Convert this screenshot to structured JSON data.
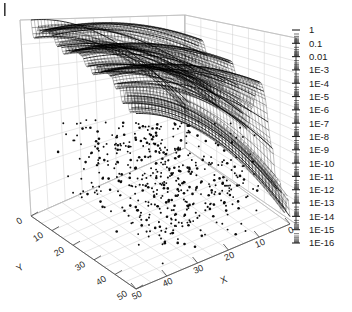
{
  "figure": {
    "type": "3d-surface-plot",
    "background": "#ffffff",
    "corner_mark": "|"
  },
  "chart_data": {
    "type": "scatter",
    "title": "",
    "subtitle": "",
    "xlabel": "X",
    "ylabel": "Y",
    "zlabel": "",
    "projection": "3d",
    "grid": true,
    "legend": "none",
    "x": {
      "label": "X",
      "ticks": [
        50,
        40,
        30,
        20,
        10,
        0
      ],
      "tick_labels": [
        "50",
        "40",
        "30",
        "20",
        "10",
        "0"
      ],
      "range": [
        50,
        0
      ],
      "reversed": true,
      "scale": "linear"
    },
    "y": {
      "label": "Y",
      "ticks": [
        0,
        10,
        20,
        30,
        40,
        50
      ],
      "tick_labels": [
        "0",
        "10",
        "20",
        "30",
        "40",
        "50"
      ],
      "range": [
        0,
        50
      ],
      "scale": "linear"
    },
    "z": {
      "label": "",
      "scale": "log",
      "range": [
        1e-16,
        1
      ],
      "tick_labels": [
        "1",
        "0.1",
        "0.01",
        "1E-3",
        "1E-4",
        "1E-5",
        "1E-6",
        "1E-7",
        "1E-8",
        "1E-9",
        "1E-10",
        "1E-11",
        "1E-12",
        "1E-13",
        "1E-14",
        "1E-15",
        "1E-16"
      ],
      "tick_values": [
        1,
        0.1,
        0.01,
        0.001,
        0.0001,
        1e-05,
        1e-06,
        1e-07,
        1e-08,
        1e-09,
        1e-10,
        1e-11,
        1e-12,
        1e-13,
        1e-14,
        1e-15,
        1e-16
      ],
      "minor_ticks_per_decade": 9
    },
    "series": [
      {
        "name": "error-surface",
        "style": "dense-mesh-curves",
        "color": "#000000",
        "description": "Oscillatory decaying surface with three ridges along Y, magnitude falling from 1 to below 1E-16"
      },
      {
        "name": "scatter-noise",
        "style": "points",
        "color": "#000000",
        "description": "Scattered low-magnitude points below the surface near machine precision"
      }
    ],
    "ridge_count": 3,
    "ridge_y_positions": [
      8,
      22,
      36
    ]
  },
  "axes": {
    "x_ticks": [
      "50",
      "40",
      "30",
      "20",
      "10",
      "0"
    ],
    "y_ticks": [
      "0",
      "10",
      "20",
      "30",
      "40",
      "50"
    ],
    "x_title": "X",
    "y_title": "Y",
    "z_ticks": [
      "1",
      "0.1",
      "0.01",
      "1E-3",
      "1E-4",
      "1E-5",
      "1E-6",
      "1E-7",
      "1E-8",
      "1E-9",
      "1E-10",
      "1E-11",
      "1E-12",
      "1E-13",
      "1E-14",
      "1E-15",
      "1E-16"
    ]
  },
  "colors": {
    "data": "#000000",
    "grid": "#c9c9c9",
    "wall_edge": "#9a9a9a",
    "axis": "#555555",
    "text": "#1a1a1a",
    "background": "#ffffff"
  }
}
